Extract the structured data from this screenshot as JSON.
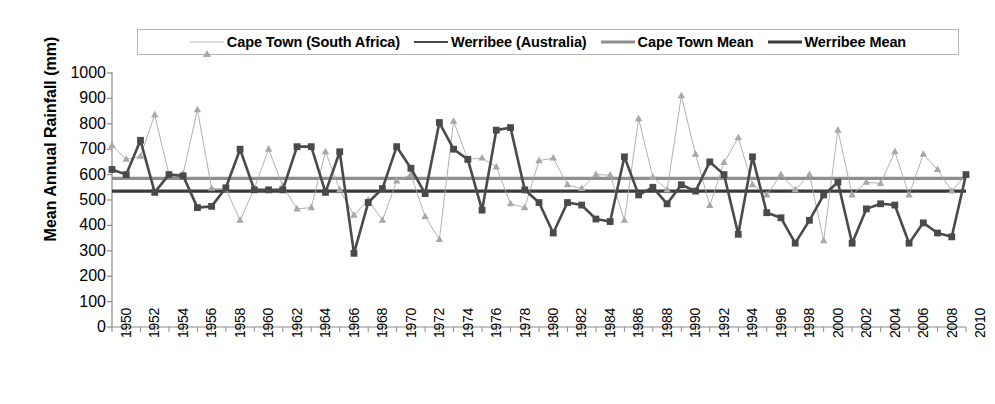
{
  "chart_data": {
    "type": "line",
    "title": "",
    "xlabel": "",
    "ylabel": "Mean Annual Rainfall (mm)",
    "ylim": [
      0,
      1000
    ],
    "ytick_step": 100,
    "yticks": [
      0,
      100,
      200,
      300,
      400,
      500,
      600,
      700,
      800,
      900,
      1000
    ],
    "xlim": [
      1950,
      2010
    ],
    "xtick_step": 1,
    "xtick_label_step": 2,
    "xticks": [
      1950,
      1951,
      1952,
      1953,
      1954,
      1955,
      1956,
      1957,
      1958,
      1959,
      1960,
      1961,
      1962,
      1963,
      1964,
      1965,
      1966,
      1967,
      1968,
      1969,
      1970,
      1971,
      1972,
      1973,
      1974,
      1975,
      1976,
      1977,
      1978,
      1979,
      1980,
      1981,
      1982,
      1983,
      1984,
      1985,
      1986,
      1987,
      1988,
      1989,
      1990,
      1991,
      1992,
      1993,
      1994,
      1995,
      1996,
      1997,
      1998,
      1999,
      2000,
      2001,
      2002,
      2003,
      2004,
      2005,
      2006,
      2007,
      2008,
      2009,
      2010
    ],
    "xtick_labels": [
      "1950",
      "1952",
      "1954",
      "1956",
      "1958",
      "1960",
      "1962",
      "1964",
      "1966",
      "1968",
      "1970",
      "1972",
      "1974",
      "1976",
      "1978",
      "1980",
      "1982",
      "1984",
      "1986",
      "1988",
      "1990",
      "1992",
      "1994",
      "1996",
      "1998",
      "2000",
      "2002",
      "2004",
      "2006",
      "2008",
      "2010"
    ],
    "grid": false,
    "legend_position": "top",
    "series": [
      {
        "name": "Cape Town (South Africa)",
        "marker": "triangle",
        "color": "#a8a8a8",
        "line_style": "thin",
        "values": [
          715,
          660,
          672,
          835,
          600,
          603,
          855,
          546,
          543,
          420,
          545,
          700,
          555,
          465,
          470,
          690,
          540,
          440,
          500,
          420,
          575,
          600,
          435,
          345,
          810,
          660,
          665,
          630,
          485,
          470,
          655,
          665,
          560,
          545,
          600,
          598,
          420,
          820,
          590,
          540,
          910,
          680,
          478,
          648,
          745,
          560,
          520,
          600,
          540,
          600,
          340,
          775,
          520,
          570,
          565,
          690,
          520,
          680,
          620,
          535,
          600
        ]
      },
      {
        "name": "Werribee (Australia)",
        "marker": "square",
        "color": "#4a4a4a",
        "line_style": "thick",
        "values": [
          620,
          600,
          735,
          530,
          600,
          595,
          470,
          475,
          548,
          700,
          540,
          540,
          540,
          710,
          710,
          530,
          690,
          290,
          490,
          545,
          710,
          625,
          525,
          805,
          700,
          660,
          460,
          775,
          785,
          540,
          490,
          370,
          490,
          480,
          425,
          415,
          670,
          520,
          550,
          485,
          560,
          535,
          650,
          600,
          365,
          670,
          450,
          430,
          330,
          420,
          520,
          570,
          330,
          465,
          485,
          480,
          330,
          410,
          370,
          355,
          600
        ]
      }
    ],
    "reference_lines": [
      {
        "name": "Cape Town Mean",
        "value": 585,
        "color": "#8e8e8e",
        "line_style": "thick"
      },
      {
        "name": "Werribee Mean",
        "value": 535,
        "color": "#3a3a3a",
        "line_style": "thick"
      }
    ]
  },
  "legend": {
    "items": [
      {
        "label": "Cape Town (South Africa)",
        "swatch": "triangle-marker-dashed-line"
      },
      {
        "label": "Werribee (Australia)",
        "swatch": "square-marker-line"
      },
      {
        "label": "Cape Town Mean",
        "swatch": "gray-solid-line"
      },
      {
        "label": "Werribee Mean",
        "swatch": "dark-solid-line"
      }
    ]
  },
  "axis": {
    "y_title": "Mean Annual Rainfall (mm)"
  }
}
